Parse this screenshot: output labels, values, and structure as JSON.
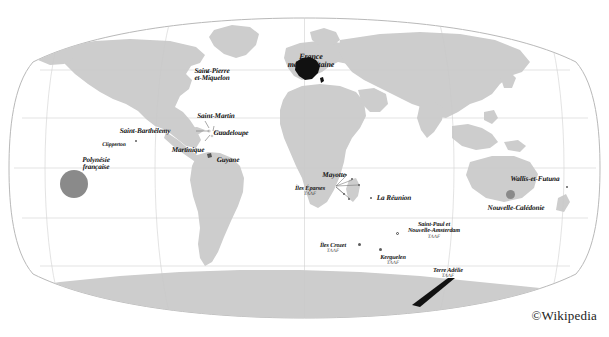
{
  "figure": {
    "title_visible": false,
    "credit": "©Wikipedia",
    "background_color": "#ffffff",
    "land_color": "#cdcdcd",
    "ocean_color": "#ffffff",
    "graticule_color": "#b4b4b4",
    "highlight_color": "#111111",
    "marker_color": "#8a8a8a",
    "projection": "Robinson"
  },
  "territories": [
    {
      "id": "saint-pierre-et-miquelon",
      "name": "Saint-Pierre",
      "name_line2": "et-Miquelon",
      "sub": "",
      "x": 212,
      "y": 68,
      "align": "center",
      "size": "lbl-sz-c",
      "marker": {
        "type": "dot-sm",
        "x": 206,
        "y": 71
      }
    },
    {
      "id": "france-metropolitaine",
      "name": "France",
      "name_line2": "métropolitaine",
      "sub": "",
      "x": 311,
      "y": 53,
      "align": "center",
      "size": "lbl-sz-b",
      "marker": null
    },
    {
      "id": "saint-martin",
      "name": "Saint-Martin",
      "name_line2": "",
      "sub": "",
      "x": 216,
      "y": 113,
      "align": "center",
      "size": "lbl-sz-c",
      "marker": null
    },
    {
      "id": "saint-barthelemy",
      "name": "Saint-Barthélemy",
      "name_line2": "",
      "sub": "",
      "x": 145,
      "y": 128,
      "align": "center",
      "size": "lbl-sz-c",
      "marker": null
    },
    {
      "id": "guadeloupe",
      "name": "Guadeloupe",
      "name_line2": "",
      "sub": "",
      "x": 231,
      "y": 130,
      "align": "center",
      "size": "lbl-sz-c",
      "marker": null
    },
    {
      "id": "martinique",
      "name": "Martinique",
      "name_line2": "",
      "sub": "",
      "x": 188,
      "y": 147,
      "align": "center",
      "size": "lbl-sz-c",
      "marker": null
    },
    {
      "id": "guyane",
      "name": "Guyane",
      "name_line2": "",
      "sub": "",
      "x": 228,
      "y": 157,
      "align": "center",
      "size": "lbl-sz-c",
      "marker": {
        "type": "dot-sm",
        "x": 208,
        "y": 155
      }
    },
    {
      "id": "clipperton",
      "name": "Clipperton",
      "name_line2": "",
      "sub": "",
      "x": 114,
      "y": 143,
      "align": "center",
      "size": "lbl-sz-e",
      "marker": {
        "type": "dot-sm",
        "x": 135,
        "y": 140
      }
    },
    {
      "id": "polynesie-francaise",
      "name": "Polynésie",
      "name_line2": "française",
      "sub": "",
      "x": 96,
      "y": 157,
      "align": "center",
      "size": "lbl-sz-c",
      "marker": null
    },
    {
      "id": "mayotte",
      "name": "Mayotte",
      "name_line2": "",
      "sub": "",
      "x": 334,
      "y": 172,
      "align": "center",
      "size": "lbl-sz-c",
      "marker": null
    },
    {
      "id": "iles-eparses",
      "name": "Îles Éparses",
      "name_line2": "",
      "sub": "TAAF",
      "x": 310,
      "y": 186,
      "align": "center",
      "size": "lbl-sz-d",
      "marker": null
    },
    {
      "id": "la-reunion",
      "name": "La Réunion",
      "name_line2": "",
      "sub": "",
      "x": 394,
      "y": 195,
      "align": "center",
      "size": "lbl-sz-c",
      "marker": {
        "type": "dot-sm",
        "x": 370,
        "y": 197
      }
    },
    {
      "id": "saint-paul-et-nouvelle-amsterdam",
      "name": "Saint-Paul et",
      "name_line2": "Nouvelle-Amsterdam",
      "sub": "TAAF",
      "x": 434,
      "y": 222,
      "align": "center",
      "size": "lbl-sz-d",
      "marker": {
        "type": "dot-ring",
        "x": 396,
        "y": 232
      }
    },
    {
      "id": "iles-crozet",
      "name": "Îles Crozet",
      "name_line2": "",
      "sub": "TAAF",
      "x": 333,
      "y": 243,
      "align": "center",
      "size": "lbl-sz-d",
      "marker": {
        "type": "dot-md",
        "x": 358,
        "y": 243
      }
    },
    {
      "id": "kerguelen",
      "name": "Kerguelen",
      "name_line2": "",
      "sub": "TAAF",
      "x": 393,
      "y": 255,
      "align": "center",
      "size": "lbl-sz-d",
      "marker": {
        "type": "dot-md",
        "x": 379,
        "y": 248
      }
    },
    {
      "id": "terre-adelie",
      "name": "Terre Adélie",
      "name_line2": "",
      "sub": "TAAF",
      "x": 448,
      "y": 268,
      "align": "center",
      "size": "lbl-sz-d",
      "marker": null
    },
    {
      "id": "wallis-et-futuna",
      "name": "Wallis-et-Futuna",
      "name_line2": "",
      "sub": "",
      "x": 535,
      "y": 176,
      "align": "center",
      "size": "lbl-sz-c",
      "marker": {
        "type": "dot-sm",
        "x": 566,
        "y": 186
      }
    },
    {
      "id": "nouvelle-caledonie",
      "name": "Nouvelle-Calédonie",
      "name_line2": "",
      "sub": "",
      "x": 516,
      "y": 205,
      "align": "center",
      "size": "lbl-sz-c",
      "marker": null
    }
  ]
}
